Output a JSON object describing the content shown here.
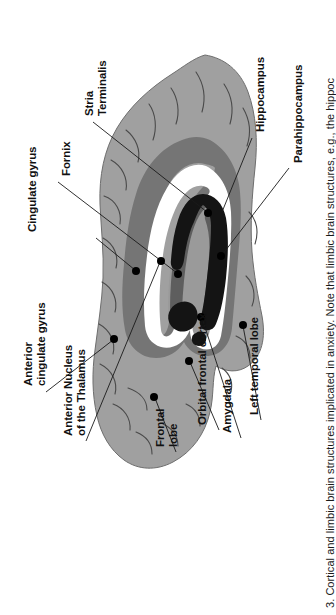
{
  "figure": {
    "kind": "anatomical-diagram",
    "subject": "Cortical and limbic brain structures implicated in anxiety",
    "orientation": "rotated-90-ccw",
    "caption": "3.  Cortical and limbic brain structures implicated in anxiety. Note that limbic brain structures, e.g., the hippoc",
    "labels": [
      {
        "id": "cingulate-gyrus",
        "text": "Cingulate gyrus",
        "lines": [
          "Cingulate gyrus"
        ]
      },
      {
        "id": "fornix",
        "text": "Fornix",
        "lines": [
          "Fornix"
        ]
      },
      {
        "id": "stria-terminalis",
        "text": "Stria Terminalis",
        "lines": [
          "Stria",
          "Terminalis"
        ]
      },
      {
        "id": "hippocampus",
        "text": "Hippocampus",
        "lines": [
          "Hippocampus"
        ]
      },
      {
        "id": "parahippocampus",
        "text": "Parahippocampus",
        "lines": [
          "Parahippocampus"
        ]
      },
      {
        "id": "anterior-cingulate-gyrus",
        "text": "Anterior cingulate gyrus",
        "lines": [
          "Anterior",
          "cingulate gyrus"
        ]
      },
      {
        "id": "anterior-nucleus-thalamus",
        "text": "Anterior Nucleus of the Thalamus",
        "lines": [
          "Anterior Nucleus",
          "of the Thalamus"
        ]
      },
      {
        "id": "frontal-lobe",
        "text": "Frontal lobe",
        "lines": [
          "Frontal",
          "lobe"
        ]
      },
      {
        "id": "orbital-frontal-cortex",
        "text": "Orbital frontal cortex",
        "lines": [
          "Orbital frontal cortex"
        ]
      },
      {
        "id": "amygdala",
        "text": "Amygdala",
        "lines": [
          "Amygdala"
        ]
      },
      {
        "id": "left-temporal-lobe",
        "text": "Left temporal lobe",
        "lines": [
          "Left temporal lobe"
        ]
      }
    ],
    "colors": {
      "cortex_gray": "#a0a0a0",
      "ring_dark_gray": "#757575",
      "ring_white": "#ffffff",
      "inner_mid_gray": "#9a9a9a",
      "dark_band": "#5e5e5e",
      "black_structure": "#141414",
      "leader_line": "#1a1a1a",
      "background": "#ffffff",
      "text": "#111111"
    }
  }
}
